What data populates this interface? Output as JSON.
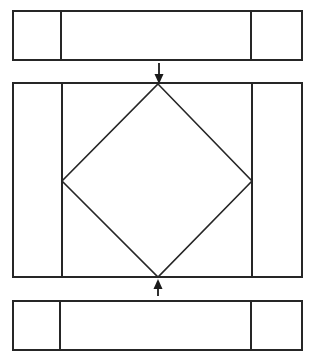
{
  "figure": {
    "type": "technical-line-drawing",
    "canvas": {
      "width": 311,
      "height": 361,
      "background": "#ffffff"
    },
    "style": {
      "line_color": "#262626",
      "fill_color": "#ffffff",
      "panel_stroke_width": 2,
      "divider_stroke_width": 2,
      "diamond_stroke_width": 1.6,
      "arrow_stroke_width": 1.8
    },
    "panels": [
      {
        "name": "top-panel",
        "label": "top-panel",
        "x": 13,
        "y": 11,
        "width": 289,
        "height": 49,
        "dividers_x": [
          61,
          251
        ],
        "cells": [
          {
            "name": "top-panel-cell-left",
            "x": 13,
            "width": 48
          },
          {
            "name": "top-panel-cell-center",
            "x": 61,
            "width": 190
          },
          {
            "name": "top-panel-cell-right",
            "x": 251,
            "width": 51
          }
        ]
      },
      {
        "name": "middle-panel",
        "label": "middle-panel",
        "x": 13,
        "y": 83,
        "width": 289,
        "height": 194,
        "dividers_x": [
          62,
          252
        ],
        "cells": [
          {
            "name": "middle-panel-cell-left",
            "x": 13,
            "width": 49
          },
          {
            "name": "middle-panel-cell-center",
            "x": 62,
            "width": 190
          },
          {
            "name": "middle-panel-cell-right",
            "x": 252,
            "width": 50
          }
        ]
      },
      {
        "name": "bottom-panel",
        "label": "bottom-panel",
        "x": 13,
        "y": 301,
        "width": 289,
        "height": 49,
        "dividers_x": [
          60,
          251
        ],
        "cells": [
          {
            "name": "bottom-panel-cell-left",
            "x": 13,
            "width": 47
          },
          {
            "name": "bottom-panel-cell-center",
            "x": 60,
            "width": 191
          },
          {
            "name": "bottom-panel-cell-right",
            "x": 251,
            "width": 51
          }
        ]
      }
    ],
    "diamond": {
      "name": "inscribed-diamond",
      "label": "inscribed-diamond",
      "vertices": {
        "top": {
          "x": 158,
          "y": 84
        },
        "right": {
          "x": 252,
          "y": 181
        },
        "bottom": {
          "x": 158,
          "y": 277
        },
        "left": {
          "x": 62,
          "y": 181
        }
      },
      "points": "158,84 252,181 158,277 62,181"
    },
    "arrows": [
      {
        "name": "load-arrow-top",
        "label": "downward-load-arrow",
        "direction": "down",
        "shaft": {
          "x1": 159,
          "y1": 63,
          "x2": 159,
          "y2": 79
        },
        "head": "159,84 154.5,74 163.5,74"
      },
      {
        "name": "load-arrow-bottom",
        "label": "upward-load-arrow",
        "direction": "up",
        "shaft": {
          "x1": 158,
          "y1": 296,
          "x2": 158,
          "y2": 285
        },
        "head": "158,279 153.5,289 162.5,289"
      }
    ]
  }
}
